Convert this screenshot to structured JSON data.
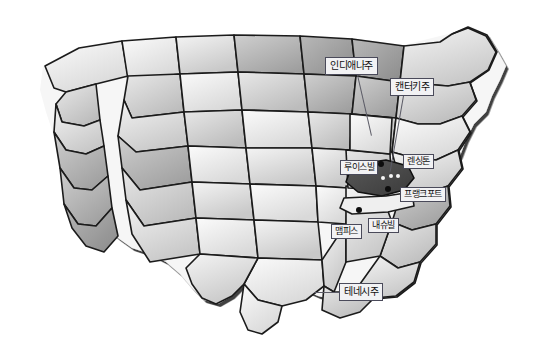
{
  "figure": {
    "kind": "map",
    "title": "",
    "region": "United States",
    "style": "grayscale hand-drawn shaded relief state map",
    "background_color": "#ffffff",
    "outline_color": "#111111",
    "highlight_state_color": "#4a4a4a",
    "label_box_color": "#f2f2f4",
    "label_border_color": "#4a4a5a",
    "label_text_color": "#101010",
    "leader_line_color": "#5b5b66"
  },
  "state_labels": [
    {
      "id": "indiana",
      "text": "인디애나주",
      "box": {
        "x": 325,
        "y": 57,
        "w": 67,
        "h": 18
      },
      "leader": {
        "x1": 358,
        "y1": 75,
        "x2": 372,
        "y2": 136
      }
    },
    {
      "id": "kentucky",
      "text": "캔터키주",
      "box": {
        "x": 390,
        "y": 78,
        "w": 57,
        "h": 18
      },
      "leader": {
        "x1": 404,
        "y1": 96,
        "x2": 391,
        "y2": 172
      }
    },
    {
      "id": "tennessee",
      "text": "테네시주",
      "box": {
        "x": 339,
        "y": 283,
        "w": 54,
        "h": 18
      },
      "leader": {
        "x1": 339,
        "y1": 292,
        "x2": 314,
        "y2": 292
      }
    }
  ],
  "city_labels": [
    {
      "id": "louisville",
      "text": "루이스빌",
      "box": {
        "x": 340,
        "y": 160,
        "w": 47,
        "h": 16
      },
      "dot": {
        "x": 381,
        "y": 164,
        "r": 3,
        "fill": "black"
      }
    },
    {
      "id": "lexington",
      "text": "렌싱톤",
      "box": {
        "x": 403,
        "y": 154,
        "w": 37,
        "h": 16
      },
      "dot": {
        "x": 397,
        "y": 177,
        "r": 2,
        "fill": "white"
      }
    },
    {
      "id": "frankfort",
      "text": "프랭크포트",
      "box": {
        "x": 400,
        "y": 187,
        "w": 56,
        "h": 16
      },
      "dot": {
        "x": 389,
        "y": 189,
        "r": 3,
        "fill": "black"
      }
    },
    {
      "id": "nashville",
      "text": "내슈빌",
      "box": {
        "x": 368,
        "y": 218,
        "w": 34,
        "h": 16
      },
      "dot": {
        "x": 359,
        "y": 210,
        "r": 3,
        "fill": "black"
      }
    },
    {
      "id": "memphis",
      "text": "맴피스",
      "box": {
        "x": 331,
        "y": 224,
        "w": 34,
        "h": 16
      },
      "dot": {
        "x": 336,
        "y": 212,
        "r": 0,
        "fill": "none"
      }
    }
  ],
  "city_markers": [
    {
      "id": "marker-lex-1",
      "x": 383,
      "y": 178,
      "r": 2,
      "fill": "white"
    },
    {
      "id": "marker-lex-2",
      "x": 391,
      "y": 176,
      "r": 2,
      "fill": "white"
    },
    {
      "id": "marker-lex-3",
      "x": 398,
      "y": 176,
      "r": 2,
      "fill": "white"
    },
    {
      "id": "marker-frankfort",
      "x": 388,
      "y": 189,
      "r": 3,
      "fill": "black"
    },
    {
      "id": "marker-louisville",
      "x": 381,
      "y": 164,
      "r": 3,
      "fill": "black"
    },
    {
      "id": "marker-nashville",
      "x": 359,
      "y": 210,
      "r": 3,
      "fill": "black"
    }
  ]
}
